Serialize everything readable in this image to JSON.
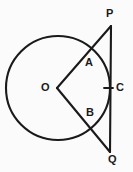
{
  "figure": {
    "type": "geometry-diagram",
    "background_color": "#fbfbfb",
    "stroke_color": "#1a1a1a",
    "label_color": "#1a1a1a",
    "labels": [
      {
        "id": "P",
        "text": "P",
        "role": "external-point-upper"
      },
      {
        "id": "A",
        "text": "A",
        "role": "circle-intersection-upper"
      },
      {
        "id": "C",
        "text": "C",
        "role": "tangent-point"
      },
      {
        "id": "O",
        "text": "O",
        "role": "circle-centre"
      },
      {
        "id": "B",
        "text": "B",
        "role": "circle-intersection-lower"
      },
      {
        "id": "Q",
        "text": "Q",
        "role": "external-point-lower"
      }
    ],
    "circle": {
      "cx": 58,
      "cy": 88,
      "r": 52
    },
    "points": {
      "O": {
        "x": 57,
        "y": 88
      },
      "P": {
        "x": 111,
        "y": 26
      },
      "Q": {
        "x": 110,
        "y": 152
      },
      "C": {
        "x": 110,
        "y": 88
      },
      "A": {
        "x": 88,
        "y": 51
      },
      "B": {
        "x": 88,
        "y": 125
      }
    },
    "segments": [
      {
        "id": "OP",
        "from": "O",
        "to": "P"
      },
      {
        "id": "OQ",
        "from": "O",
        "to": "Q"
      },
      {
        "id": "PQ",
        "from": "P",
        "to": "Q"
      }
    ],
    "tick_mark": {
      "x1": 104,
      "y1": 88,
      "x2": 113,
      "y2": 88
    }
  }
}
